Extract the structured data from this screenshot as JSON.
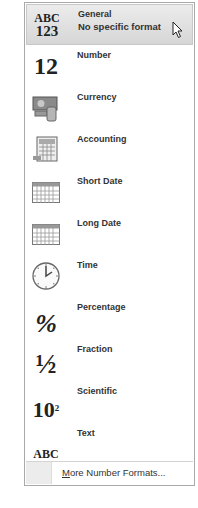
{
  "menu": {
    "items": [
      {
        "id": "general",
        "label": "General",
        "sublabel": "No specific format",
        "icon": "abc-123-icon",
        "icon_text_top": "ABC",
        "icon_text_bottom": "123",
        "highlighted": true
      },
      {
        "id": "number",
        "label": "Number",
        "icon": "number-12-icon",
        "icon_text": "12"
      },
      {
        "id": "currency",
        "label": "Currency",
        "icon": "currency-icon"
      },
      {
        "id": "accounting",
        "label": "Accounting",
        "icon": "accounting-icon"
      },
      {
        "id": "short-date",
        "label": "Short Date",
        "icon": "calendar-icon"
      },
      {
        "id": "long-date",
        "label": "Long Date",
        "icon": "calendar-icon"
      },
      {
        "id": "time",
        "label": "Time",
        "icon": "clock-icon"
      },
      {
        "id": "percentage",
        "label": "Percentage",
        "icon": "percent-icon",
        "icon_text": "%"
      },
      {
        "id": "fraction",
        "label": "Fraction",
        "icon": "fraction-icon",
        "icon_text": "½"
      },
      {
        "id": "scientific",
        "label": "Scientific",
        "icon": "scientific-icon",
        "icon_text": "10",
        "icon_sup": "2"
      },
      {
        "id": "text",
        "label": "Text",
        "icon": "abc-text-icon",
        "icon_text": "ABC"
      }
    ],
    "footer": {
      "label_first": "M",
      "label_rest": "ore Number Formats..."
    }
  },
  "colors": {
    "highlight": "#d9d9d9",
    "border": "#a9a9a9",
    "text": "#333333"
  }
}
